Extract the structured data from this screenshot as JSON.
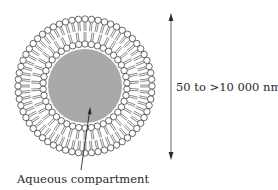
{
  "diagram": {
    "labels": {
      "size": "50 to >10 000 nm",
      "core": "Aqueous compartment"
    },
    "components": {
      "outer_leaflet": "phospholipid heads facing outward, tails inward",
      "inner_leaflet": "phospholipid heads facing inward, tails outward",
      "core": "aqueous compartment (gray fill)",
      "dimension_arrow": "double-headed vertical arrow indicating diameter"
    },
    "colors": {
      "core_fill": "#a9a9a9",
      "line": "#2a2a2a",
      "head_fill": "#ffffff",
      "background": "#ffffff"
    },
    "geometry": {
      "center": [
        85,
        86
      ],
      "outer_head_radius": 67,
      "inner_head_radius": 42,
      "core_radius": 37,
      "head_size": 3.2,
      "outer_head_count": 64,
      "inner_head_count": 42
    }
  }
}
